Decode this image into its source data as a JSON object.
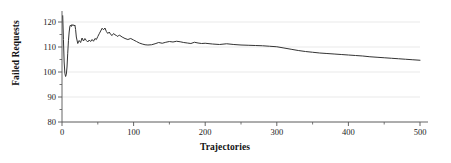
{
  "chart_data": {
    "type": "line",
    "title": "",
    "xlabel": "Trajectories",
    "ylabel": "Failed Requests",
    "xlim": [
      0,
      500
    ],
    "ylim": [
      80,
      123
    ],
    "grid": "horizontal",
    "legend": "none",
    "line_color": "#333333",
    "background_color": "#ffffff",
    "gridline_color": "#e3e3e3",
    "axis_color": "#555555",
    "xticks": [
      0,
      100,
      200,
      300,
      400,
      500
    ],
    "xtick_labels": [
      "0",
      "100",
      "200",
      "300",
      "400",
      "500"
    ],
    "xminor_step": 50,
    "yticks": [
      80,
      90,
      100,
      110,
      120
    ],
    "ytick_labels": [
      "80",
      "90",
      "100",
      "110",
      "120"
    ],
    "yminor_step": 5,
    "series": [
      {
        "name": "Failed Requests",
        "x": [
          1,
          2,
          3,
          4,
          5,
          6,
          7,
          8,
          9,
          10,
          11,
          12,
          13,
          14,
          15,
          16,
          17,
          18,
          19,
          20,
          22,
          24,
          26,
          28,
          30,
          32,
          34,
          36,
          38,
          40,
          42,
          44,
          46,
          48,
          50,
          52,
          54,
          56,
          58,
          60,
          62,
          64,
          66,
          68,
          70,
          72,
          74,
          76,
          78,
          80,
          84,
          88,
          92,
          96,
          100,
          104,
          108,
          112,
          116,
          120,
          125,
          130,
          135,
          140,
          145,
          150,
          155,
          160,
          165,
          170,
          175,
          180,
          185,
          190,
          195,
          200,
          210,
          220,
          230,
          240,
          250,
          260,
          270,
          280,
          290,
          300,
          310,
          320,
          330,
          340,
          350,
          360,
          370,
          380,
          390,
          400,
          410,
          420,
          430,
          440,
          450,
          460,
          470,
          480,
          490,
          500
        ],
        "y": [
          122.5,
          113.0,
          104.0,
          99.5,
          98.2,
          99.0,
          102.0,
          107.5,
          112.5,
          116.0,
          118.3,
          118.8,
          118.2,
          119.0,
          118.6,
          118.9,
          118.4,
          118.8,
          117.0,
          114.0,
          111.4,
          112.6,
          111.8,
          113.6,
          112.4,
          113.4,
          112.6,
          112.0,
          112.8,
          112.2,
          113.0,
          112.3,
          113.4,
          113.0,
          114.2,
          115.3,
          116.4,
          117.5,
          116.9,
          117.6,
          116.2,
          115.4,
          116.0,
          115.0,
          114.6,
          115.4,
          114.9,
          114.6,
          114.2,
          114.8,
          114.0,
          113.4,
          113.0,
          113.4,
          112.8,
          112.2,
          111.6,
          111.2,
          110.9,
          110.8,
          110.9,
          111.3,
          111.8,
          111.5,
          111.9,
          112.2,
          112.0,
          112.3,
          112.1,
          111.8,
          111.6,
          111.4,
          111.9,
          111.6,
          111.4,
          111.5,
          111.2,
          111.0,
          111.3,
          111.0,
          110.8,
          110.7,
          110.6,
          110.5,
          110.3,
          110.1,
          109.6,
          109.1,
          108.6,
          108.2,
          107.9,
          107.6,
          107.4,
          107.2,
          107.0,
          106.8,
          106.6,
          106.4,
          106.1,
          105.9,
          105.7,
          105.5,
          105.3,
          105.1,
          104.9,
          104.7
        ]
      }
    ]
  }
}
